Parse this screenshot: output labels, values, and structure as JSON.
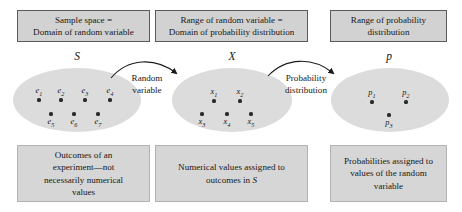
{
  "diagram": {
    "title_boxes": [
      {
        "id": "sample-space",
        "line1": "Sample space =",
        "line2": "Domain of random variable"
      },
      {
        "id": "range-random-variable",
        "line1": "Range of random variable =",
        "line2": "Domain of probability distribution"
      },
      {
        "id": "range-probability",
        "line1": "Range of probability",
        "line2": "distribution"
      }
    ],
    "set_letters": [
      {
        "id": "set-letter-s",
        "text": "S"
      },
      {
        "id": "set-letter-x",
        "text": "X"
      },
      {
        "id": "set-letter-p",
        "text": "p"
      }
    ],
    "ellipses": [
      {
        "id": "sample-space-ellipse",
        "set_letter": "S",
        "points": [
          {
            "label": "e",
            "sub": "1"
          },
          {
            "label": "e",
            "sub": "2"
          },
          {
            "label": "e",
            "sub": "3"
          },
          {
            "label": "e",
            "sub": "4"
          },
          {
            "label": "e",
            "sub": "5"
          },
          {
            "label": "e",
            "sub": "6"
          },
          {
            "label": "e",
            "sub": "7"
          }
        ]
      },
      {
        "id": "random-variable-ellipse",
        "set_letter": "X",
        "points": [
          {
            "label": "x",
            "sub": "1"
          },
          {
            "label": "x",
            "sub": "2"
          },
          {
            "label": "x",
            "sub": "3"
          },
          {
            "label": "x",
            "sub": "4"
          },
          {
            "label": "x",
            "sub": "5"
          }
        ]
      },
      {
        "id": "probability-ellipse",
        "set_letter": "p",
        "points": [
          {
            "label": "p",
            "sub": "1"
          },
          {
            "label": "p",
            "sub": "2"
          },
          {
            "label": "p",
            "sub": "3"
          }
        ]
      }
    ],
    "arrows": [
      {
        "id": "random-variable-arrow",
        "line1": "Random",
        "line2": "variable"
      },
      {
        "id": "probability-distribution-arrow",
        "line1": "Probability",
        "line2": "distribution"
      }
    ],
    "caption_boxes": [
      {
        "id": "outcomes-caption",
        "line1": "Outcomes of an",
        "line2": "experiment—not",
        "line3": "necessarily numerical",
        "line4": "values"
      },
      {
        "id": "numerical-values-caption",
        "line1": "Numerical values assigned to",
        "line2_prefix": "outcomes in ",
        "line2_italic": "S",
        "line3": "",
        "line4": ""
      },
      {
        "id": "probabilities-caption",
        "line1": "Probabilities assigned to",
        "line2": "values of the random",
        "line3": "variable",
        "line4": ""
      }
    ],
    "colors": {
      "box_fill": "#d2d2d2",
      "box_border": "#5a5a5a",
      "caption_fill": "#d6d6d6",
      "caption_border": "#b2b2b2",
      "ellipse_fill": "#dcdcdc",
      "dot": "#2c2c2c",
      "text": "#171717",
      "background": "#ffffff"
    }
  }
}
